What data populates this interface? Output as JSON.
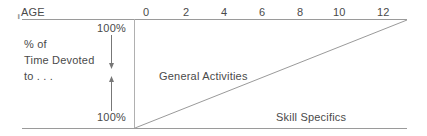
{
  "diagram": {
    "axis_label": "AGE",
    "age_ticks": [
      "0",
      "2",
      "4",
      "6",
      "8",
      "10",
      "12"
    ],
    "y_label_lines": [
      "% of",
      "Time Devoted",
      "to . . ."
    ],
    "top_percent": "100%",
    "bottom_percent": "100%",
    "regions": {
      "upper": "General Activities",
      "lower": "Skill Specifics"
    },
    "colors": {
      "line": "#9a9a9a",
      "text": "#4a4a4a"
    }
  }
}
